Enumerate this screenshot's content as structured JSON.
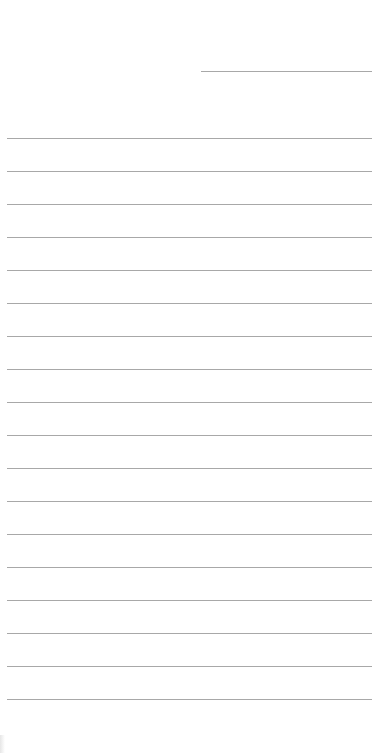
{
  "page": {
    "type": "lined-paper",
    "background_color": "#ffffff",
    "line_color": "#a8a8a8",
    "header_line": {
      "x_start": 201,
      "x_end": 372,
      "y": 71
    },
    "ruled_lines": {
      "count": 18,
      "first_y": 138,
      "spacing": 33,
      "x_start": 7,
      "x_end": 372
    }
  }
}
